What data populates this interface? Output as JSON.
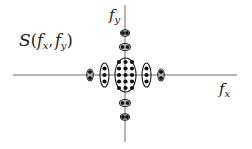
{
  "diagram": {
    "title_label": {
      "main": "S",
      "open": "(",
      "f1": "f",
      "s1": "x",
      "comma": ",",
      "f2": "f",
      "s2": "y",
      "close": ")"
    },
    "x_axis_label": {
      "main": "f",
      "sub": "x"
    },
    "y_axis_label": {
      "main": "f",
      "sub": "y"
    },
    "axes": {
      "horizontal": {
        "x1": 13,
        "x2": 237,
        "y": 75
      },
      "vertical": {
        "x": 125,
        "y1": 5,
        "y2": 142
      }
    },
    "clusters": [
      {
        "name": "center",
        "cx": 125.5,
        "cy": 75,
        "rx": 10.5,
        "ry": 17,
        "dots": {
          "cols": [
            119,
            125.5,
            132
          ],
          "rows": [
            62,
            68.5,
            75,
            81.5,
            88
          ]
        }
      },
      {
        "name": "left-inner",
        "cx": 104.5,
        "cy": 75,
        "rx": 4.5,
        "ry": 12,
        "dots": {
          "cols": [
            104.5
          ],
          "rows": [
            68.5,
            75,
            81.5
          ]
        }
      },
      {
        "name": "right-inner",
        "cx": 146.5,
        "cy": 75,
        "rx": 4.5,
        "ry": 12,
        "dots": {
          "cols": [
            146.5
          ],
          "rows": [
            68.5,
            75,
            81.5
          ]
        }
      },
      {
        "name": "left-outer",
        "cx": 90,
        "cy": 75,
        "rx": 3.2,
        "ry": 6,
        "dots": {
          "cols": [
            90
          ],
          "rows": [
            72,
            78
          ]
        }
      },
      {
        "name": "right-outer",
        "cx": 161,
        "cy": 75,
        "rx": 3.2,
        "ry": 6,
        "dots": {
          "cols": [
            161
          ],
          "rows": [
            72,
            78
          ]
        }
      },
      {
        "name": "top-inner",
        "cx": 125,
        "cy": 47,
        "rx": 5.5,
        "ry": 3.5,
        "dots": {
          "cols": [
            122.5,
            127.5
          ],
          "rows": [
            47
          ]
        }
      },
      {
        "name": "top-outer",
        "cx": 125,
        "cy": 33,
        "rx": 4.5,
        "ry": 3.3,
        "dots": {
          "cols": [
            123,
            127
          ],
          "rows": [
            33
          ]
        }
      },
      {
        "name": "bottom-inner",
        "cx": 125,
        "cy": 103,
        "rx": 5.5,
        "ry": 3.5,
        "dots": {
          "cols": [
            122.5,
            127.5
          ],
          "rows": [
            103
          ]
        }
      },
      {
        "name": "bottom-outer",
        "cx": 125,
        "cy": 117,
        "rx": 4.5,
        "ry": 3.3,
        "dots": {
          "cols": [
            123,
            127
          ],
          "rows": [
            117
          ]
        }
      }
    ],
    "colors": {
      "axis": "#6a6a6a",
      "ink": "#111111",
      "background": "#ffffff"
    }
  }
}
